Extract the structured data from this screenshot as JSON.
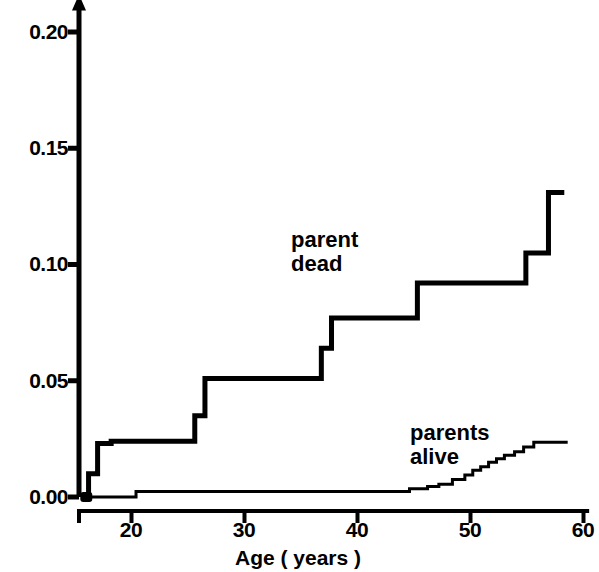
{
  "chart_data": {
    "type": "line",
    "subtype": "step-cumulative-incidence",
    "title": "",
    "xlabel": "Age ( years )",
    "ylabel": "",
    "xlim": [
      15.2,
      60.5
    ],
    "ylim": [
      0.0,
      0.205
    ],
    "grid": false,
    "legend_position": "inline-annotations",
    "xticks": [
      20,
      30,
      40,
      50,
      60
    ],
    "xtick_labels": [
      "20",
      "30",
      "40",
      "50",
      "60"
    ],
    "yticks": [
      0.0,
      0.05,
      0.1,
      0.15,
      0.2
    ],
    "ytick_labels": [
      "0.00",
      "0.05",
      "0.10",
      "0.15",
      "0.20"
    ],
    "axis_arrow_y": true,
    "origin_marker": {
      "x": 16.0,
      "y": 0.0,
      "shape": "filled-square-dot"
    },
    "series": [
      {
        "name": "parent dead",
        "label": "parent\ndead",
        "color": "#000000",
        "line_width": 5,
        "points": [
          [
            16.0,
            0.0
          ],
          [
            16.2,
            0.0
          ],
          [
            16.2,
            0.01
          ],
          [
            17.0,
            0.01
          ],
          [
            17.0,
            0.023
          ],
          [
            18.2,
            0.023
          ],
          [
            18.2,
            0.024
          ],
          [
            20.2,
            0.024
          ],
          [
            25.6,
            0.024
          ],
          [
            25.6,
            0.035
          ],
          [
            26.5,
            0.035
          ],
          [
            26.5,
            0.051
          ],
          [
            36.8,
            0.051
          ],
          [
            36.8,
            0.064
          ],
          [
            37.7,
            0.064
          ],
          [
            37.7,
            0.077
          ],
          [
            45.3,
            0.077
          ],
          [
            45.3,
            0.092
          ],
          [
            54.9,
            0.092
          ],
          [
            54.9,
            0.105
          ],
          [
            56.9,
            0.105
          ],
          [
            56.9,
            0.131
          ],
          [
            58.3,
            0.131
          ]
        ]
      },
      {
        "name": "parents alive",
        "label": "parents\nalive",
        "color": "#000000",
        "line_width": 3,
        "points": [
          [
            16.0,
            0.0
          ],
          [
            20.4,
            0.0
          ],
          [
            20.4,
            0.0024
          ],
          [
            44.6,
            0.0024
          ],
          [
            44.6,
            0.0035
          ],
          [
            46.2,
            0.0035
          ],
          [
            46.2,
            0.0045
          ],
          [
            47.2,
            0.0045
          ],
          [
            47.2,
            0.0055
          ],
          [
            48.4,
            0.0055
          ],
          [
            48.4,
            0.0075
          ],
          [
            49.5,
            0.0075
          ],
          [
            49.5,
            0.0095
          ],
          [
            50.2,
            0.0095
          ],
          [
            50.2,
            0.0115
          ],
          [
            50.9,
            0.0115
          ],
          [
            50.9,
            0.013
          ],
          [
            51.6,
            0.013
          ],
          [
            51.6,
            0.015
          ],
          [
            52.3,
            0.015
          ],
          [
            52.3,
            0.0165
          ],
          [
            53.0,
            0.0165
          ],
          [
            53.0,
            0.018
          ],
          [
            53.9,
            0.018
          ],
          [
            53.9,
            0.0195
          ],
          [
            54.7,
            0.0195
          ],
          [
            54.7,
            0.0215
          ],
          [
            55.6,
            0.0215
          ],
          [
            55.6,
            0.0235
          ],
          [
            58.6,
            0.0235
          ]
        ]
      }
    ],
    "annotations": [
      {
        "text_line1": "parent",
        "text_line2": "dead",
        "x": 34.5,
        "y": 0.118
      },
      {
        "text_line1": "parents",
        "text_line2": "alive",
        "x": 50.8,
        "y": 0.036
      }
    ]
  },
  "axes": {
    "x_title": "Age ( years )",
    "x_tick_labels": [
      "20",
      "30",
      "40",
      "50",
      "60"
    ],
    "y_tick_labels": [
      "0.00",
      "0.05",
      "0.10",
      "0.15",
      "0.20"
    ]
  },
  "series_labels": {
    "parent_dead_line1": "parent",
    "parent_dead_line2": "dead",
    "parents_alive_line1": "parents",
    "parents_alive_line2": "alive"
  },
  "colors": {
    "ink": "#000000",
    "background": "#ffffff"
  }
}
